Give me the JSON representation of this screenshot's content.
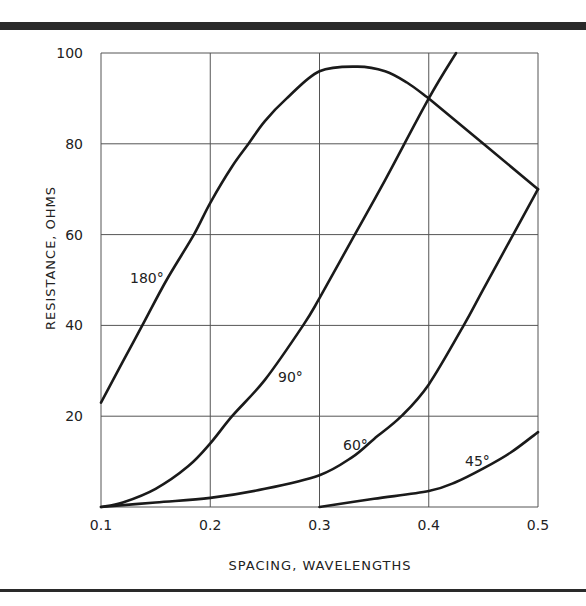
{
  "chart_data": {
    "type": "line",
    "title": "",
    "xlabel": "SPACING, WAVELENGTHS",
    "ylabel": "RESISTANCE, OHMS",
    "xlim": [
      0.1,
      0.5
    ],
    "ylim": [
      0,
      100
    ],
    "grid": true,
    "x_ticks": [
      "0.1",
      "0.2",
      "0.3",
      "0.4",
      "0.5"
    ],
    "y_ticks": [
      "20",
      "40",
      "60",
      "80",
      "100"
    ],
    "series": [
      {
        "name": "180°",
        "x": [
          0.1,
          0.12,
          0.14,
          0.16,
          0.185,
          0.2,
          0.22,
          0.235,
          0.25,
          0.27,
          0.3,
          0.335,
          0.36,
          0.38,
          0.4,
          0.45,
          0.5
        ],
        "y": [
          23,
          32,
          41,
          50,
          60,
          67,
          75,
          80,
          85,
          90,
          96,
          97,
          96,
          93.5,
          90,
          80,
          70
        ]
      },
      {
        "name": "90°",
        "x": [
          0.1,
          0.12,
          0.15,
          0.18,
          0.2,
          0.22,
          0.25,
          0.285,
          0.3,
          0.33,
          0.36,
          0.4,
          0.425
        ],
        "y": [
          0,
          1,
          4,
          9,
          14,
          20,
          28,
          40,
          46,
          59,
          72,
          90,
          100
        ]
      },
      {
        "name": "60°",
        "x": [
          0.1,
          0.15,
          0.2,
          0.25,
          0.3,
          0.33,
          0.35,
          0.375,
          0.4,
          0.432,
          0.45,
          0.475,
          0.5
        ],
        "y": [
          0,
          1,
          2,
          4,
          7,
          11,
          15,
          20,
          27,
          40,
          48,
          59,
          70
        ]
      },
      {
        "name": "45°",
        "x": [
          0.3,
          0.35,
          0.4,
          0.425,
          0.45,
          0.475,
          0.5
        ],
        "y": [
          0,
          1.8,
          3.5,
          5.5,
          8.5,
          12,
          16.5
        ]
      }
    ],
    "annotations": [
      "180°",
      "90°",
      "60°",
      "45°"
    ]
  },
  "labels": {
    "xlabel": "SPACING, WAVELENGTHS",
    "ylabel": "RESISTANCE, OHMS"
  }
}
